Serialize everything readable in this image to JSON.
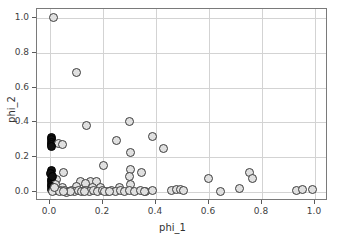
{
  "chart_data": {
    "type": "scatter",
    "title": "",
    "xlabel": "phi_1",
    "ylabel": "phi_2",
    "xlim": [
      -0.05,
      1.05
    ],
    "ylim": [
      -0.05,
      1.05
    ],
    "grid": true,
    "legend": null,
    "xticks": [
      "0.0",
      "0.2",
      "0.4",
      "0.6",
      "0.8",
      "1.0"
    ],
    "xtick_values": [
      0.0,
      0.2,
      0.4,
      0.6,
      0.8,
      1.0
    ],
    "yticks": [
      "0.0",
      "0.2",
      "0.4",
      "0.6",
      "0.8",
      "1.0"
    ],
    "ytick_values": [
      0.0,
      0.2,
      0.4,
      0.6,
      0.8,
      1.0
    ],
    "marker": "circle",
    "marker_facecolor": "#e0e0e0",
    "marker_edgecolor": "#3c3c3c",
    "dark_marker_facecolor": "#111111",
    "points": [
      {
        "x": 0.012,
        "y": 1.0,
        "dark": false
      },
      {
        "x": 0.098,
        "y": 0.688,
        "dark": false
      },
      {
        "x": 0.3,
        "y": 0.405,
        "dark": false
      },
      {
        "x": 0.138,
        "y": 0.382,
        "dark": false
      },
      {
        "x": 0.388,
        "y": 0.318,
        "dark": false
      },
      {
        "x": 0.006,
        "y": 0.315,
        "dark": true
      },
      {
        "x": 0.004,
        "y": 0.3,
        "dark": true
      },
      {
        "x": 0.003,
        "y": 0.288,
        "dark": true
      },
      {
        "x": 0.006,
        "y": 0.276,
        "dark": true
      },
      {
        "x": 0.03,
        "y": 0.277,
        "dark": false
      },
      {
        "x": 0.046,
        "y": 0.273,
        "dark": false
      },
      {
        "x": 0.004,
        "y": 0.262,
        "dark": true
      },
      {
        "x": 0.25,
        "y": 0.294,
        "dark": false
      },
      {
        "x": 0.428,
        "y": 0.252,
        "dark": false
      },
      {
        "x": 0.302,
        "y": 0.229,
        "dark": false
      },
      {
        "x": 0.2,
        "y": 0.155,
        "dark": false
      },
      {
        "x": 0.305,
        "y": 0.13,
        "dark": false
      },
      {
        "x": 0.05,
        "y": 0.115,
        "dark": false
      },
      {
        "x": 0.003,
        "y": 0.122,
        "dark": true
      },
      {
        "x": 0.002,
        "y": 0.108,
        "dark": true
      },
      {
        "x": 0.753,
        "y": 0.112,
        "dark": false
      },
      {
        "x": 0.345,
        "y": 0.111,
        "dark": false
      },
      {
        "x": 0.298,
        "y": 0.088,
        "dark": false
      },
      {
        "x": 0.6,
        "y": 0.081,
        "dark": false
      },
      {
        "x": 0.766,
        "y": 0.079,
        "dark": false
      },
      {
        "x": 0.003,
        "y": 0.074,
        "dark": true
      },
      {
        "x": 0.022,
        "y": 0.076,
        "dark": false
      },
      {
        "x": 0.003,
        "y": 0.06,
        "dark": true
      },
      {
        "x": 0.115,
        "y": 0.061,
        "dark": false
      },
      {
        "x": 0.152,
        "y": 0.062,
        "dark": false
      },
      {
        "x": 0.176,
        "y": 0.059,
        "dark": false
      },
      {
        "x": 0.135,
        "y": 0.048,
        "dark": false
      },
      {
        "x": 0.003,
        "y": 0.044,
        "dark": true
      },
      {
        "x": 0.02,
        "y": 0.046,
        "dark": false
      },
      {
        "x": 0.302,
        "y": 0.042,
        "dark": false
      },
      {
        "x": 0.003,
        "y": 0.032,
        "dark": true
      },
      {
        "x": 0.045,
        "y": 0.03,
        "dark": false
      },
      {
        "x": 0.1,
        "y": 0.031,
        "dark": false
      },
      {
        "x": 0.16,
        "y": 0.03,
        "dark": false
      },
      {
        "x": 0.19,
        "y": 0.028,
        "dark": false
      },
      {
        "x": 0.26,
        "y": 0.027,
        "dark": false
      },
      {
        "x": 0.715,
        "y": 0.023,
        "dark": false
      },
      {
        "x": 0.93,
        "y": 0.013,
        "dark": false
      },
      {
        "x": 0.955,
        "y": 0.016,
        "dark": false
      },
      {
        "x": 0.99,
        "y": 0.018,
        "dark": false
      },
      {
        "x": 0.003,
        "y": 0.016,
        "dark": true
      },
      {
        "x": 0.012,
        "y": 0.012,
        "dark": true
      },
      {
        "x": 0.028,
        "y": 0.01,
        "dark": false
      },
      {
        "x": 0.04,
        "y": 0.008,
        "dark": false
      },
      {
        "x": 0.055,
        "y": 0.012,
        "dark": false
      },
      {
        "x": 0.068,
        "y": 0.007,
        "dark": false
      },
      {
        "x": 0.08,
        "y": 0.011,
        "dark": false
      },
      {
        "x": 0.092,
        "y": 0.006,
        "dark": false
      },
      {
        "x": 0.105,
        "y": 0.01,
        "dark": false
      },
      {
        "x": 0.12,
        "y": 0.006,
        "dark": false
      },
      {
        "x": 0.133,
        "y": 0.01,
        "dark": false
      },
      {
        "x": 0.147,
        "y": 0.007,
        "dark": false
      },
      {
        "x": 0.162,
        "y": 0.011,
        "dark": false
      },
      {
        "x": 0.178,
        "y": 0.006,
        "dark": false
      },
      {
        "x": 0.196,
        "y": 0.01,
        "dark": false
      },
      {
        "x": 0.215,
        "y": 0.007,
        "dark": false
      },
      {
        "x": 0.232,
        "y": 0.012,
        "dark": false
      },
      {
        "x": 0.248,
        "y": 0.006,
        "dark": false
      },
      {
        "x": 0.265,
        "y": 0.01,
        "dark": false
      },
      {
        "x": 0.282,
        "y": 0.007,
        "dark": false
      },
      {
        "x": 0.3,
        "y": 0.01,
        "dark": false
      },
      {
        "x": 0.32,
        "y": 0.006,
        "dark": false
      },
      {
        "x": 0.34,
        "y": 0.009,
        "dark": false
      },
      {
        "x": 0.362,
        "y": 0.007,
        "dark": false
      },
      {
        "x": 0.385,
        "y": 0.009,
        "dark": false
      },
      {
        "x": 0.46,
        "y": 0.013,
        "dark": false
      },
      {
        "x": 0.476,
        "y": 0.015,
        "dark": false
      },
      {
        "x": 0.492,
        "y": 0.016,
        "dark": false
      },
      {
        "x": 0.502,
        "y": 0.013,
        "dark": false
      },
      {
        "x": 0.645,
        "y": 0.004,
        "dark": false
      },
      {
        "x": 0.01,
        "y": 0.002,
        "dark": false
      },
      {
        "x": 0.035,
        "y": 0.002,
        "dark": false
      },
      {
        "x": 0.06,
        "y": 0.001,
        "dark": false
      },
      {
        "x": 0.075,
        "y": 0.003,
        "dark": false
      },
      {
        "x": 0.128,
        "y": 0.002,
        "dark": false
      },
      {
        "x": 0.205,
        "y": 0.002,
        "dark": false
      },
      {
        "x": 0.225,
        "y": 0.003,
        "dark": false
      },
      {
        "x": 0.355,
        "y": 0.002,
        "dark": false
      },
      {
        "x": 0.05,
        "y": 0.003,
        "dark": false
      },
      {
        "x": 0.018,
        "y": 0.03,
        "dark": false
      },
      {
        "x": 0.01,
        "y": 0.09,
        "dark": true
      }
    ]
  }
}
